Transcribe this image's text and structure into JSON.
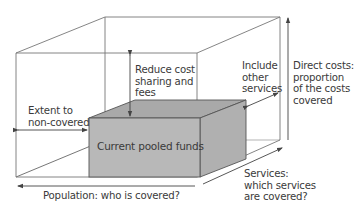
{
  "diagram": {
    "type": "3d-cube",
    "title": "",
    "box_label": "Current pooled funds",
    "labels": {
      "reduce_cost": [
        "Reduce cost",
        "sharing and",
        "fees"
      ],
      "include_other": [
        "Include",
        "other",
        "services"
      ],
      "direct_costs": [
        "Direct costs:",
        "proportion",
        "of the costs",
        "covered"
      ],
      "extent": [
        "Extent to",
        "non-covered"
      ],
      "population": "Population: who is covered?",
      "services": [
        "Services:",
        "which services",
        "are covered?"
      ]
    },
    "colors": {
      "box_fill": "#b8b8b8",
      "box_top": "#a9a9a9",
      "box_side": "#b0b0b0",
      "line": "#555555",
      "text": "#3a3a3a"
    }
  }
}
